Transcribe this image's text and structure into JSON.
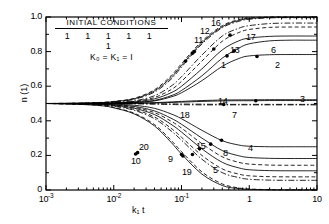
{
  "figure": {
    "background": "#ffffff",
    "line_color": "#000000"
  },
  "legend": {
    "title": "INITIAL CONDITIONS",
    "initial_values": "1 1 1 1 1 1",
    "constants": "K₀ = K₁ = I"
  },
  "axes": {
    "y_title": "n (1)",
    "x_title": "k₁ t",
    "y_ticks": [
      "0",
      "0.2",
      "0.4",
      "0.6",
      "0.8",
      "1.0"
    ],
    "x_ticks": [
      "10",
      "10",
      "10",
      "1",
      "10"
    ],
    "x_tick_exponents": [
      "-3",
      "-2",
      "-1",
      "",
      ""
    ]
  },
  "chart_data": {
    "type": "line",
    "title": "",
    "xlabel": "k₁ t",
    "ylabel": "n (1)",
    "xscale": "log",
    "xlim": [
      0.001,
      10
    ],
    "ylim": [
      0.0,
      1.0
    ],
    "grid": false,
    "legend_position": "inline-curve-labels",
    "x": [
      0.001,
      0.002,
      0.004,
      0.007,
      0.01,
      0.02,
      0.04,
      0.07,
      0.1,
      0.2,
      0.4,
      0.7,
      1.0,
      2.0,
      4.0,
      7.0,
      10.0
    ],
    "series": [
      {
        "name": "16",
        "label": "16",
        "style": "dashed",
        "values": [
          0.5,
          0.501,
          0.503,
          0.507,
          0.512,
          0.53,
          0.58,
          0.66,
          0.73,
          0.86,
          0.95,
          0.985,
          0.995,
          1.0,
          1.0,
          1.0,
          1.0
        ]
      },
      {
        "name": "12",
        "label": "12",
        "style": "solid",
        "values": [
          0.5,
          0.501,
          0.503,
          0.506,
          0.511,
          0.527,
          0.573,
          0.65,
          0.72,
          0.852,
          0.944,
          0.98,
          0.991,
          0.998,
          0.999,
          0.999,
          0.999
        ]
      },
      {
        "name": "11",
        "label": "11",
        "style": "dashdot",
        "values": [
          0.5,
          0.501,
          0.502,
          0.505,
          0.51,
          0.524,
          0.566,
          0.64,
          0.71,
          0.844,
          0.938,
          0.975,
          0.987,
          0.995,
          0.996,
          0.996,
          0.996
        ]
      },
      {
        "name": "17",
        "label": "17",
        "style": "dashdot",
        "values": [
          0.5,
          0.5,
          0.501,
          0.503,
          0.506,
          0.515,
          0.545,
          0.6,
          0.655,
          0.78,
          0.89,
          0.935,
          0.95,
          0.962,
          0.965,
          0.965,
          0.965
        ]
      },
      {
        "name": "13",
        "label": "13",
        "style": "dashed",
        "values": [
          0.5,
          0.5,
          0.501,
          0.502,
          0.504,
          0.512,
          0.535,
          0.58,
          0.628,
          0.745,
          0.86,
          0.91,
          0.928,
          0.94,
          0.942,
          0.942,
          0.942
        ]
      },
      {
        "name": "6",
        "label": "6",
        "style": "solid",
        "values": [
          0.5,
          0.5,
          0.501,
          0.502,
          0.503,
          0.509,
          0.527,
          0.562,
          0.6,
          0.7,
          0.81,
          0.862,
          0.878,
          0.888,
          0.89,
          0.89,
          0.89
        ]
      },
      {
        "name": "1",
        "label": "1",
        "style": "solid",
        "values": [
          0.5,
          0.5,
          0.5,
          0.501,
          0.502,
          0.506,
          0.518,
          0.545,
          0.575,
          0.66,
          0.762,
          0.82,
          0.845,
          0.862,
          0.866,
          0.866,
          0.866
        ]
      },
      {
        "name": "2",
        "label": "2",
        "style": "solid",
        "values": [
          0.5,
          0.5,
          0.5,
          0.501,
          0.502,
          0.505,
          0.515,
          0.538,
          0.562,
          0.632,
          0.715,
          0.76,
          0.775,
          0.782,
          0.783,
          0.783,
          0.783
        ]
      },
      {
        "name": "14",
        "label": "14",
        "style": "solid",
        "values": [
          0.5,
          0.5,
          0.5,
          0.5,
          0.501,
          0.502,
          0.505,
          0.509,
          0.512,
          0.517,
          0.52,
          0.521,
          0.521,
          0.522,
          0.522,
          0.522,
          0.522
        ]
      },
      {
        "name": "3",
        "label": "3",
        "style": "solid",
        "values": [
          0.5,
          0.5,
          0.5,
          0.5,
          0.5,
          0.501,
          0.503,
          0.506,
          0.508,
          0.512,
          0.515,
          0.516,
          0.516,
          0.517,
          0.517,
          0.517,
          0.517
        ]
      },
      {
        "name": "18",
        "label": "18",
        "style": "dashdot",
        "values": [
          0.5,
          0.5,
          0.5,
          0.5,
          0.5,
          0.5,
          0.499,
          0.498,
          0.497,
          0.496,
          0.495,
          0.495,
          0.495,
          0.495,
          0.495,
          0.495,
          0.495
        ]
      },
      {
        "name": "7",
        "label": "7",
        "style": "dashdot",
        "values": [
          0.5,
          0.5,
          0.5,
          0.5,
          0.499,
          0.498,
          0.496,
          0.494,
          0.493,
          0.492,
          0.492,
          0.492,
          0.492,
          0.492,
          0.492,
          0.492,
          0.492
        ]
      },
      {
        "name": "4",
        "label": "4",
        "style": "solid",
        "values": [
          0.5,
          0.5,
          0.499,
          0.498,
          0.496,
          0.49,
          0.472,
          0.44,
          0.412,
          0.345,
          0.285,
          0.26,
          0.253,
          0.25,
          0.25,
          0.25,
          0.25
        ]
      },
      {
        "name": "8",
        "label": "8",
        "style": "solid",
        "values": [
          0.5,
          0.499,
          0.498,
          0.496,
          0.493,
          0.483,
          0.457,
          0.415,
          0.38,
          0.3,
          0.228,
          0.198,
          0.188,
          0.183,
          0.182,
          0.182,
          0.182
        ]
      },
      {
        "name": "15",
        "label": "15",
        "style": "dashed",
        "values": [
          0.5,
          0.499,
          0.498,
          0.495,
          0.491,
          0.478,
          0.447,
          0.398,
          0.358,
          0.268,
          0.192,
          0.16,
          0.15,
          0.144,
          0.143,
          0.143,
          0.143
        ]
      },
      {
        "name": "5",
        "label": "5",
        "style": "solid",
        "values": [
          0.5,
          0.499,
          0.497,
          0.494,
          0.489,
          0.473,
          0.436,
          0.38,
          0.335,
          0.238,
          0.16,
          0.128,
          0.117,
          0.112,
          0.111,
          0.111,
          0.111
        ]
      },
      {
        "name": "9",
        "label": "9",
        "style": "dashed",
        "values": [
          0.5,
          0.499,
          0.496,
          0.492,
          0.486,
          0.466,
          0.422,
          0.357,
          0.305,
          0.2,
          0.122,
          0.092,
          0.082,
          0.077,
          0.076,
          0.076,
          0.076
        ]
      },
      {
        "name": "19",
        "label": "19",
        "style": "dashdot",
        "values": [
          0.5,
          0.498,
          0.496,
          0.491,
          0.484,
          0.461,
          0.412,
          0.342,
          0.288,
          0.178,
          0.1,
          0.072,
          0.062,
          0.057,
          0.056,
          0.056,
          0.056
        ]
      },
      {
        "name": "20",
        "label": "20",
        "style": "dashed",
        "values": [
          0.5,
          0.498,
          0.494,
          0.487,
          0.477,
          0.444,
          0.378,
          0.288,
          0.222,
          0.105,
          0.035,
          0.012,
          0.006,
          0.002,
          0.001,
          0.001,
          0.001
        ]
      },
      {
        "name": "10",
        "label": "10",
        "style": "solid",
        "values": [
          0.5,
          0.498,
          0.493,
          0.486,
          0.475,
          0.44,
          0.37,
          0.276,
          0.208,
          0.092,
          0.026,
          0.008,
          0.004,
          0.001,
          0.0,
          0.0,
          0.0
        ]
      }
    ],
    "curve_label_positions": [
      {
        "label": "16",
        "x": 211,
        "y": 18
      },
      {
        "label": "12",
        "x": 200,
        "y": 26
      },
      {
        "label": "11",
        "x": 194,
        "y": 35
      },
      {
        "label": "17",
        "x": 246,
        "y": 32
      },
      {
        "label": "13",
        "x": 230,
        "y": 45
      },
      {
        "label": "6",
        "x": 271,
        "y": 45
      },
      {
        "label": "1",
        "x": 221,
        "y": 60
      },
      {
        "label": "2",
        "x": 275,
        "y": 60
      },
      {
        "label": "14",
        "x": 218,
        "y": 96
      },
      {
        "label": "3",
        "x": 300,
        "y": 94
      },
      {
        "label": "18",
        "x": 180,
        "y": 110
      },
      {
        "label": "7",
        "x": 232,
        "y": 110
      },
      {
        "label": "4",
        "x": 248,
        "y": 143
      },
      {
        "label": "8",
        "x": 223,
        "y": 148
      },
      {
        "label": "15",
        "x": 196,
        "y": 141
      },
      {
        "label": "5",
        "x": 213,
        "y": 165
      },
      {
        "label": "9",
        "x": 168,
        "y": 154
      },
      {
        "label": "19",
        "x": 182,
        "y": 167
      },
      {
        "label": "20",
        "x": 139,
        "y": 142
      },
      {
        "label": "10",
        "x": 131,
        "y": 156
      }
    ],
    "marker_points": [
      {
        "series": "16",
        "x": 0.145,
        "y": 0.79
      },
      {
        "series": "11",
        "x": 0.115,
        "y": 0.745
      },
      {
        "series": "12",
        "x": 0.155,
        "y": 0.8
      },
      {
        "series": "17",
        "x": 0.52,
        "y": 0.895
      },
      {
        "series": "13",
        "x": 0.3,
        "y": 0.815
      },
      {
        "series": "6",
        "x": 0.6,
        "y": 0.805
      },
      {
        "series": "1",
        "x": 0.47,
        "y": 0.775
      },
      {
        "series": "2",
        "x": 1.3,
        "y": 0.772
      },
      {
        "series": "3",
        "x": 1.25,
        "y": 0.516
      },
      {
        "series": "7",
        "x": 0.42,
        "y": 0.494
      },
      {
        "series": "4",
        "x": 0.39,
        "y": 0.288
      },
      {
        "series": "8",
        "x": 0.27,
        "y": 0.265
      },
      {
        "series": "15",
        "x": 0.185,
        "y": 0.238
      },
      {
        "series": "5",
        "x": 0.145,
        "y": 0.205
      },
      {
        "series": "9",
        "x": 0.1,
        "y": 0.205
      },
      {
        "series": "19",
        "x": 0.105,
        "y": 0.197
      },
      {
        "series": "20",
        "x": 0.0225,
        "y": 0.216
      },
      {
        "series": "10",
        "x": 0.021,
        "y": 0.208
      }
    ]
  }
}
